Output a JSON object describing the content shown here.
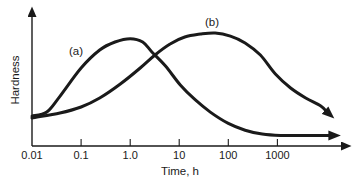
{
  "figure": {
    "background_color": "#ffffff",
    "ink_color": "#1a1a1a"
  },
  "chart_data": {
    "type": "line",
    "title": "",
    "xlabel": "Time, h",
    "ylabel": "Hardness",
    "x_scale": "log",
    "x_range": [
      0.01,
      30000
    ],
    "ylim_relative": [
      0,
      1.22
    ],
    "grid": false,
    "legend_position": "inline-curve-labels",
    "x_ticks": [
      0.1,
      1,
      10,
      100,
      1000
    ],
    "x_tick_labels": [
      "0.01",
      "0.1",
      "1.0",
      "10",
      "100",
      "1000"
    ],
    "x_tick_label_values": [
      0.01,
      0.1,
      1,
      10,
      100,
      1000
    ],
    "y_axis_numeric_scale_shown": false,
    "series": [
      {
        "name": "curve-a",
        "label": "(a)",
        "values_are_relative_hardness": true,
        "points": [
          [
            0.01,
            0.265
          ],
          [
            0.02,
            0.3
          ],
          [
            0.037,
            0.44
          ],
          [
            0.1,
            0.69
          ],
          [
            0.24,
            0.85
          ],
          [
            0.49,
            0.92
          ],
          [
            1.0,
            0.95
          ],
          [
            1.8,
            0.92
          ],
          [
            2.8,
            0.83
          ],
          [
            5.2,
            0.71
          ],
          [
            10.5,
            0.54
          ],
          [
            21,
            0.41
          ],
          [
            43,
            0.3
          ],
          [
            100,
            0.2
          ],
          [
            220,
            0.14
          ],
          [
            490,
            0.105
          ],
          [
            1150,
            0.093
          ],
          [
            3000,
            0.093
          ],
          [
            12000,
            0.093
          ]
        ]
      },
      {
        "name": "curve-b",
        "label": "(b)",
        "values_are_relative_hardness": true,
        "points": [
          [
            0.01,
            0.248
          ],
          [
            0.037,
            0.292
          ],
          [
            0.1,
            0.345
          ],
          [
            0.24,
            0.425
          ],
          [
            0.63,
            0.549
          ],
          [
            1.6,
            0.69
          ],
          [
            3.2,
            0.805
          ],
          [
            6.5,
            0.903
          ],
          [
            13,
            0.965
          ],
          [
            27,
            0.991
          ],
          [
            54,
            1.0
          ],
          [
            110,
            0.973
          ],
          [
            220,
            0.912
          ],
          [
            450,
            0.805
          ],
          [
            910,
            0.637
          ],
          [
            1860,
            0.513
          ],
          [
            3770,
            0.425
          ],
          [
            7650,
            0.354
          ],
          [
            10000,
            0.305
          ]
        ]
      }
    ]
  }
}
